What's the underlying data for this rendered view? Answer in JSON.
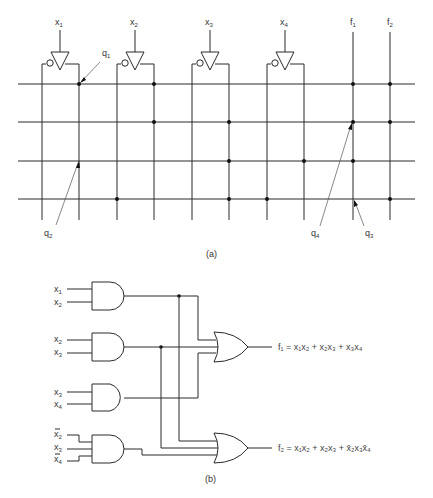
{
  "figure_a": {
    "caption": "(a)",
    "inputs": [
      {
        "name": "x",
        "sub": "1",
        "x_true": 79,
        "x_comp": 42,
        "center": 60
      },
      {
        "name": "x",
        "sub": "2",
        "x_true": 154,
        "x_comp": 117,
        "center": 135
      },
      {
        "name": "x",
        "sub": "3",
        "x_true": 229,
        "x_comp": 192,
        "center": 210
      },
      {
        "name": "x",
        "sub": "4",
        "x_true": 304,
        "x_comp": 267,
        "center": 285
      }
    ],
    "outputs": [
      {
        "name": "f",
        "sub": "1",
        "x": 353
      },
      {
        "name": "f",
        "sub": "2",
        "x": 390
      }
    ],
    "rows_y": [
      84,
      122,
      161,
      199
    ],
    "connections": [
      {
        "row": 0,
        "x": [
          79,
          154,
          353,
          390
        ]
      },
      {
        "row": 1,
        "x": [
          154,
          229,
          353,
          390
        ]
      },
      {
        "row": 2,
        "x": [
          229,
          304,
          353
        ]
      },
      {
        "row": 3,
        "x": [
          117,
          229,
          267,
          390
        ]
      }
    ],
    "annotations": [
      {
        "label": "q",
        "sub": "1"
      },
      {
        "label": "q",
        "sub": "2"
      },
      {
        "label": "q",
        "sub": "3"
      },
      {
        "label": "q",
        "sub": "4"
      }
    ]
  },
  "figure_b": {
    "caption": "(b)",
    "and_gates": [
      {
        "inputs": [
          "x1",
          "x2"
        ],
        "labels": [
          {
            "t": "x",
            "s": "1",
            "bar": false
          },
          {
            "t": "x",
            "s": "2",
            "bar": false
          }
        ]
      },
      {
        "inputs": [
          "x2",
          "x3"
        ],
        "labels": [
          {
            "t": "x",
            "s": "2",
            "bar": false
          },
          {
            "t": "x",
            "s": "3",
            "bar": false
          }
        ]
      },
      {
        "inputs": [
          "x3",
          "x4"
        ],
        "labels": [
          {
            "t": "x",
            "s": "3",
            "bar": false
          },
          {
            "t": "x",
            "s": "4",
            "bar": false
          }
        ]
      },
      {
        "inputs": [
          "x2'",
          "x3",
          "x4'"
        ],
        "labels": [
          {
            "t": "x",
            "s": "2",
            "bar": true
          },
          {
            "t": "x",
            "s": "3",
            "bar": false
          },
          {
            "t": "x",
            "s": "4",
            "bar": true
          }
        ]
      }
    ],
    "or_gates": [
      {
        "output": "f1",
        "equation": "f₁ = x₁x₂ + x₂x₃ + x₃x₄"
      },
      {
        "output": "f2",
        "equation": "f₂ = x₁x₂ + x₂x₃ + x̄₂x₃x̄₄"
      }
    ]
  }
}
